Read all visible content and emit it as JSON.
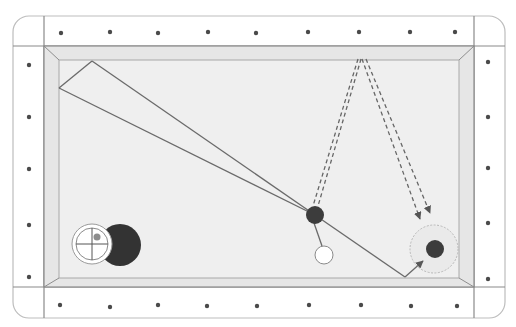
{
  "diagram": {
    "type": "billiards-table-shot-diagram",
    "colors": {
      "background": "#ffffff",
      "rail": "#ffffff",
      "rail_line": "#8a8a8a",
      "frame_line": "#bdbdbd",
      "cushion": "#e6e6e6",
      "cloth": "#efefef",
      "diamond": "#4a4a4a",
      "shot_line": "#6a6a6a",
      "dashed_line": "#666666",
      "ball_dark": "#3c3c3c",
      "ball_white": "#ffffff",
      "target_zone": "#b8b8b8",
      "english_dot": "#8c8c8c"
    },
    "table": {
      "frame": {
        "x": 13,
        "y": 16,
        "w": 492,
        "h": 302,
        "r": 16
      },
      "rail_lines": {
        "left": 44,
        "right": 474,
        "top": 46,
        "bottom": 287
      },
      "cloth": {
        "x1": 59,
        "y1": 60,
        "x2": 459,
        "y2": 278
      }
    },
    "diamonds": {
      "top": [
        [
          61,
          33
        ],
        [
          110,
          32
        ],
        [
          158,
          33
        ],
        [
          208,
          32
        ],
        [
          256,
          33
        ],
        [
          308,
          32
        ],
        [
          359,
          32
        ],
        [
          410,
          32
        ],
        [
          455,
          32
        ]
      ],
      "bottom": [
        [
          60,
          305
        ],
        [
          110,
          307
        ],
        [
          158,
          305
        ],
        [
          207,
          306
        ],
        [
          257,
          306
        ],
        [
          309,
          305
        ],
        [
          361,
          305
        ],
        [
          411,
          306
        ],
        [
          457,
          306
        ]
      ],
      "left": [
        [
          29,
          65
        ],
        [
          29,
          117
        ],
        [
          29,
          169
        ],
        [
          29,
          225
        ],
        [
          29,
          277
        ]
      ],
      "right": [
        [
          488,
          62
        ],
        [
          488,
          117
        ],
        [
          488,
          168
        ],
        [
          488,
          223
        ],
        [
          488,
          279
        ]
      ]
    },
    "balls": {
      "object_ball": {
        "name": "object-ball",
        "cx": 315,
        "cy": 215,
        "r": 9,
        "color": "dark"
      },
      "cue_ball": {
        "name": "cue-ball",
        "cx": 324,
        "cy": 255,
        "r": 9,
        "color": "white"
      },
      "target_ball": {
        "name": "target-ball",
        "cx": 435,
        "cy": 249,
        "r": 9,
        "color": "dark"
      },
      "target_zone": {
        "cx": 434,
        "cy": 249,
        "r": 24
      }
    },
    "shot_paths": {
      "wedge_upper": [
        [
          92,
          61
        ],
        [
          315,
          215
        ]
      ],
      "wedge_lower": [
        [
          59,
          88
        ],
        [
          315,
          215
        ]
      ],
      "wedge_cap": [
        [
          92,
          61
        ],
        [
          59,
          88
        ]
      ],
      "cue_to_object": [
        [
          314,
          223
        ],
        [
          322,
          246
        ]
      ],
      "deflection": [
        [
          315,
          215
        ],
        [
          405,
          277
        ]
      ],
      "rebound_arrow": [
        [
          405,
          277
        ],
        [
          423,
          261
        ]
      ]
    },
    "dashed_paths": [
      [
        [
          358,
          59
        ],
        [
          313,
          206
        ]
      ],
      [
        [
          361,
          59
        ],
        [
          318,
          206
        ]
      ],
      [
        [
          362,
          59
        ],
        [
          420,
          219
        ]
      ],
      [
        [
          366,
          59
        ],
        [
          430,
          213
        ]
      ]
    ],
    "english_indicator": {
      "cue_face": {
        "cx": 92,
        "cy": 244,
        "r": 20
      },
      "inner_circle_r": 16,
      "shadow_ball": {
        "cx": 120,
        "cy": 245,
        "r": 21
      },
      "contact_dot": {
        "cx": 97,
        "cy": 237,
        "r": 3.5
      }
    }
  }
}
